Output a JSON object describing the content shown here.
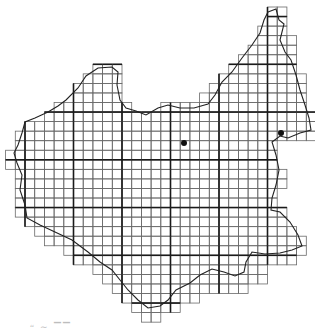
{
  "map": {
    "grid": {
      "origin_x": 5.6,
      "origin_y": 7,
      "cell_w": 9.7,
      "cell_h": 9.55,
      "thick_every": 5,
      "thick_col_offset": 2,
      "thick_row_offset": 1,
      "thin_color": "#6a6a6a",
      "thick_color": "#1a1a1a"
    },
    "rows": [
      {
        "r": 0,
        "spans": [
          [
            27,
            28
          ]
        ]
      },
      {
        "r": 1,
        "spans": [
          [
            27,
            28
          ]
        ]
      },
      {
        "r": 2,
        "spans": [
          [
            26,
            28
          ]
        ]
      },
      {
        "r": 3,
        "spans": [
          [
            26,
            29
          ]
        ]
      },
      {
        "r": 4,
        "spans": [
          [
            25,
            29
          ]
        ]
      },
      {
        "r": 5,
        "spans": [
          [
            24,
            29
          ]
        ]
      },
      {
        "r": 6,
        "spans": [
          [
            9,
            11
          ],
          [
            23,
            29
          ]
        ]
      },
      {
        "r": 7,
        "spans": [
          [
            8,
            11
          ],
          [
            22,
            30
          ]
        ]
      },
      {
        "r": 8,
        "spans": [
          [
            7,
            11
          ],
          [
            21,
            30
          ]
        ]
      },
      {
        "r": 9,
        "spans": [
          [
            7,
            11
          ],
          [
            20,
            30
          ]
        ]
      },
      {
        "r": 10,
        "spans": [
          [
            5,
            12
          ],
          [
            16,
            30
          ]
        ]
      },
      {
        "r": 11,
        "spans": [
          [
            4,
            31
          ]
        ]
      },
      {
        "r": 12,
        "spans": [
          [
            2,
            31
          ]
        ]
      },
      {
        "r": 13,
        "spans": [
          [
            1,
            31
          ]
        ]
      },
      {
        "r": 14,
        "spans": [
          [
            1,
            27
          ]
        ]
      },
      {
        "r": 15,
        "spans": [
          [
            0,
            27
          ]
        ]
      },
      {
        "r": 16,
        "spans": [
          [
            0,
            27
          ]
        ]
      },
      {
        "r": 17,
        "spans": [
          [
            1,
            28
          ]
        ]
      },
      {
        "r": 18,
        "spans": [
          [
            1,
            28
          ]
        ]
      },
      {
        "r": 19,
        "spans": [
          [
            1,
            27
          ]
        ]
      },
      {
        "r": 20,
        "spans": [
          [
            1,
            27
          ]
        ]
      },
      {
        "r": 21,
        "spans": [
          [
            1,
            28
          ]
        ]
      },
      {
        "r": 22,
        "spans": [
          [
            2,
            28
          ]
        ]
      },
      {
        "r": 23,
        "spans": [
          [
            3,
            29
          ]
        ]
      },
      {
        "r": 24,
        "spans": [
          [
            4,
            30
          ]
        ]
      },
      {
        "r": 25,
        "spans": [
          [
            6,
            30
          ]
        ]
      },
      {
        "r": 26,
        "spans": [
          [
            7,
            29
          ]
        ]
      },
      {
        "r": 27,
        "spans": [
          [
            9,
            26
          ]
        ]
      },
      {
        "r": 28,
        "spans": [
          [
            10,
            26
          ]
        ]
      },
      {
        "r": 29,
        "spans": [
          [
            11,
            24
          ]
        ]
      },
      {
        "r": 30,
        "spans": [
          [
            12,
            19
          ]
        ]
      },
      {
        "r": 31,
        "spans": [
          [
            13,
            17
          ]
        ]
      },
      {
        "r": 32,
        "spans": [
          [
            14,
            15
          ]
        ]
      }
    ],
    "border_path": "M 268,12 L 276,9 L 279,20 L 284,24 L 280,40 L 285,52 L 291,60 L 296,75 L 300,90 L 305,105 L 309,118 L 311,130 L 300,133 L 288,138 L 280,136 L 272,142 L 276,155 L 279,170 L 276,185 L 272,198 L 271,210 L 280,212 L 290,222 L 298,235 L 302,246 L 292,250 L 280,253 L 265,254 L 252,252 L 246,262 L 244,272 L 235,276 L 224,272 L 212,269 L 200,275 L 190,283 L 176,290 L 168,300 L 160,306 L 148,308 L 138,300 L 128,290 L 120,280 L 112,270 L 100,262 L 88,252 L 72,240 L 55,232 L 40,225 L 27,218 L 25,205 L 20,190 L 22,175 L 17,163 L 14,153 L 18,145 L 22,133 L 25,122 L 35,118 L 48,112 L 58,106 L 66,100 L 78,88 L 86,76 L 98,68 L 112,67 L 118,72 L 117,85 L 120,100 L 126,108 L 136,111 L 146,115 L 158,108 L 168,105 L 180,108 L 194,108 L 208,104 L 215,95 L 222,82 L 232,72 L 242,58 L 252,45 L 260,33 L 264,20 Z",
    "points": [
      {
        "name": "site-1",
        "x": 184,
        "y": 143,
        "r": 3
      },
      {
        "name": "site-2",
        "x": 281,
        "y": 133,
        "r": 3
      }
    ]
  },
  "caption": "“ ∼   ▔▔"
}
